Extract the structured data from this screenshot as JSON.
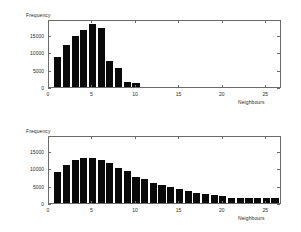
{
  "figure": {
    "background": "#ffffff",
    "bar_color": "#0a0a0a",
    "axis_color": "#6a6a6a",
    "text_color": "#2b2b2b"
  },
  "chart_data": [
    {
      "type": "bar",
      "id": "top-histogram",
      "title": "",
      "xlabel": "Neighbours",
      "ylabel": "Frequency",
      "xlim": [
        0,
        26.8
      ],
      "ylim": [
        0,
        19500
      ],
      "xticks": [
        0,
        5,
        10,
        15,
        20,
        25
      ],
      "xticklabels": [
        "0",
        "5",
        "10",
        "15",
        "20",
        "25"
      ],
      "yticks": [
        0,
        5000,
        10000,
        15000
      ],
      "yticklabels": [
        "0",
        "5000",
        "10000",
        "15000"
      ],
      "grid": false,
      "legend": false,
      "categories": [
        1,
        2,
        3,
        4,
        5,
        6,
        7,
        8,
        9,
        10
      ],
      "values": [
        8500,
        12000,
        14500,
        16400,
        18000,
        17000,
        7600,
        5400,
        1400,
        1200
      ]
    },
    {
      "type": "bar",
      "id": "bottom-histogram",
      "title": "",
      "xlabel": "Neighbours",
      "ylabel": "Frequency",
      "xlim": [
        0,
        26.8
      ],
      "ylim": [
        0,
        19500
      ],
      "xticks": [
        0,
        5,
        10,
        15,
        20,
        25
      ],
      "xticklabels": [
        "0",
        "5",
        "10",
        "15",
        "20",
        "25"
      ],
      "yticks": [
        0,
        5000,
        10000,
        15000
      ],
      "yticklabels": [
        "0",
        "5000",
        "10000",
        "15000"
      ],
      "grid": false,
      "legend": false,
      "categories": [
        1,
        2,
        3,
        4,
        5,
        6,
        7,
        8,
        9,
        10,
        11,
        12,
        13,
        14,
        15,
        16,
        17,
        18,
        19,
        20,
        21,
        22,
        23,
        24,
        25,
        26
      ],
      "values": [
        9000,
        11000,
        12200,
        12800,
        12800,
        12400,
        11400,
        10100,
        9200,
        7600,
        6800,
        5700,
        5200,
        4600,
        4100,
        3500,
        3000,
        2500,
        2400,
        2000,
        1400,
        1400,
        1400,
        1400,
        1400,
        1500
      ]
    }
  ]
}
